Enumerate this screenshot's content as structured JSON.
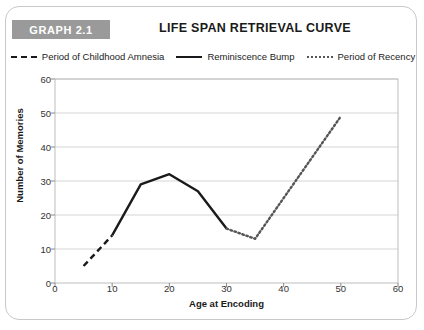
{
  "figure": {
    "badge_label": "GRAPH 2.1",
    "badge_color": "#9a9a9a",
    "frame_color": "#c9c9c9",
    "background": "#ffffff"
  },
  "chart_data": {
    "type": "line",
    "title": "LIFE SPAN RETRIEVAL CURVE",
    "xlabel": "Age at Encoding",
    "ylabel": "Number of Memories",
    "xlim": [
      0,
      60
    ],
    "ylim": [
      0,
      60
    ],
    "xticks": [
      0,
      10,
      20,
      30,
      40,
      50,
      60
    ],
    "yticks": [
      0,
      10,
      20,
      30,
      40,
      50,
      60
    ],
    "grid": "horizontal",
    "legend_position": "top-center",
    "series": [
      {
        "name": "Period of Childhood Amnesia",
        "style": "dashed",
        "color": "#1a1a1a",
        "points": [
          [
            5,
            5
          ],
          [
            10,
            14
          ]
        ]
      },
      {
        "name": "Reminiscence Bump",
        "style": "solid",
        "color": "#1a1a1a",
        "points": [
          [
            10,
            14
          ],
          [
            15,
            29
          ],
          [
            20,
            32
          ],
          [
            25,
            27
          ],
          [
            30,
            16
          ]
        ]
      },
      {
        "name": "Period of Recency",
        "style": "dotted",
        "color": "#555555",
        "points": [
          [
            30,
            16
          ],
          [
            35,
            13
          ],
          [
            50,
            49
          ]
        ]
      }
    ]
  }
}
